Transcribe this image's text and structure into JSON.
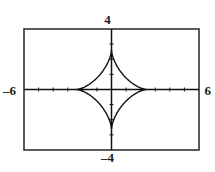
{
  "graph": {
    "labels": {
      "xmin": "–6",
      "xmax": "6",
      "ymax": "4",
      "ymin": "–4"
    }
  },
  "chart_data": {
    "type": "line",
    "title": "",
    "xlabel": "",
    "ylabel": "",
    "xlim": [
      -6,
      6
    ],
    "ylim": [
      -4,
      4
    ],
    "grid": false,
    "legend": null,
    "curve_name": "astroid",
    "equation": "x^(2/3) + y^(2/3) = a^(2/3)",
    "parametric": {
      "x": "a*cos(t)^3",
      "y": "b*sin(t)^3",
      "a": 2.4,
      "b": 2.6,
      "t_range": [
        0,
        6.283185
      ]
    },
    "cusps": [
      {
        "x": -2.4,
        "y": 0
      },
      {
        "x": 2.4,
        "y": 0
      },
      {
        "x": 0,
        "y": 2.6
      },
      {
        "x": 0,
        "y": -2.6
      }
    ],
    "x_ticks": [
      -5,
      -4,
      -3,
      -2,
      -1,
      0,
      1,
      2,
      3,
      4,
      5
    ],
    "y_ticks": [
      -3,
      -2,
      -1,
      0,
      1,
      2,
      3
    ],
    "tick_labels_visible": false,
    "axes_visible": true,
    "frame_visible": true,
    "colors": {
      "curve": "#111111",
      "axis": "#111111",
      "frame": "#333333",
      "background": "#ffffff",
      "label": "#1a1a1a"
    }
  }
}
